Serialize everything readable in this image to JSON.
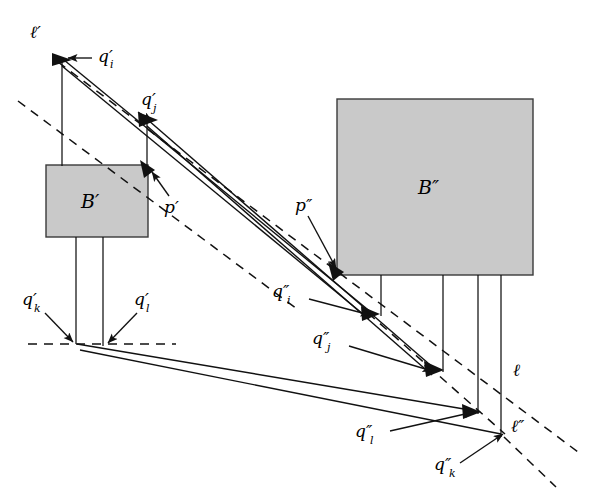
{
  "figure": {
    "background_color": "#ffffff",
    "stroke_color": "#1a1a1a",
    "box_fill_color": "#c8c8c8",
    "box_stroke_color": "#333333"
  },
  "boxes": [
    {
      "id": "B-prime",
      "label": "B′",
      "x": 46,
      "y": 165,
      "w": 102,
      "h": 72
    },
    {
      "id": "B-dprime",
      "label": "B″",
      "x": 337,
      "y": 99,
      "w": 196,
      "h": 176
    }
  ],
  "labels": {
    "l_prime": {
      "text": "ℓ′",
      "x": 30,
      "y": 38
    },
    "q_i_prime": {
      "text": "q′",
      "sub": "i",
      "x": 98,
      "y": 62
    },
    "q_j_prime": {
      "text": "q′",
      "sub": "j",
      "x": 141,
      "y": 105
    },
    "p_prime": {
      "text": "p′",
      "x": 166,
      "y": 211
    },
    "q_k_prime": {
      "text": "q′",
      "sub": "k",
      "x": 22,
      "y": 305
    },
    "q_l_prime": {
      "text": "q′",
      "sub": "l",
      "x": 134,
      "y": 305
    },
    "p_dprime": {
      "text": "p″",
      "x": 297,
      "y": 210
    },
    "q_i_dprime": {
      "text": "q″",
      "sub": "i",
      "x": 274,
      "y": 297
    },
    "q_j_dprime": {
      "text": "q″",
      "sub": "j",
      "x": 313,
      "y": 344
    },
    "q_l_dprime": {
      "text": "q″",
      "sub": "l",
      "x": 357,
      "y": 437
    },
    "q_k_dprime": {
      "text": "q″",
      "sub": "k",
      "x": 436,
      "y": 470
    },
    "l_plain": {
      "text": "ℓ",
      "x": 514,
      "y": 375
    },
    "l_dprime": {
      "text": "ℓ″",
      "x": 512,
      "y": 432
    }
  },
  "geometry": {
    "vertex_l_prime": [
      62,
      58
    ],
    "vertex_q_j_prime": [
      147,
      118
    ],
    "vertex_p_prime": [
      146,
      166
    ],
    "vertex_q_k_prime": [
      76,
      344
    ],
    "vertex_q_l_prime": [
      103,
      345
    ],
    "vertex_p_dprime": [
      335,
      272
    ],
    "vertex_q_i_dprime": [
      372,
      314
    ],
    "vertex_q_j_dprime": [
      436,
      369
    ],
    "vertex_q_l_dprime": [
      474,
      411
    ],
    "vertex_q_k_dprime": [
      502,
      434
    ],
    "verticals_under_B_dprime_x": [
      381,
      443,
      478,
      501
    ],
    "verticals_under_B_prime_x": [
      76,
      103
    ],
    "dashed_baseline_y": 344
  }
}
